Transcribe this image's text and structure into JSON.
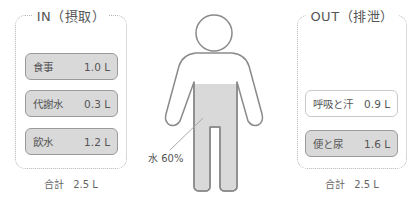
{
  "in_panel": {
    "title": "IN（摂取）",
    "items": [
      {
        "label": "食事",
        "value": "1.0 L",
        "style": "gray"
      },
      {
        "label": "代謝水",
        "value": "0.3 L",
        "style": "gray"
      },
      {
        "label": "飲水",
        "value": "1.2 L",
        "style": "gray"
      }
    ],
    "total_label": "合計",
    "total_value": "2.5 L"
  },
  "out_panel": {
    "title": "OUT（排泄）",
    "items": [
      {
        "label": "呼吸と汗",
        "value": "0.9 L",
        "style": "white"
      },
      {
        "label": "便と尿",
        "value": "1.6 L",
        "style": "gray"
      }
    ],
    "total_label": "合計",
    "total_value": "2.5 L"
  },
  "figure": {
    "water_label": "水 60%"
  },
  "colors": {
    "fill_gray": "#d9d9d9",
    "outline": "#8a8a8a",
    "dotted_border": "#b4b4b4"
  }
}
